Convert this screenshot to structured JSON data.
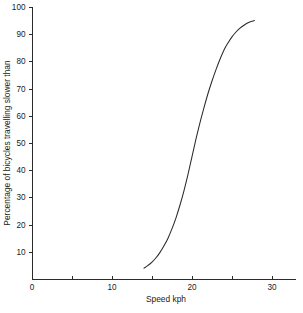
{
  "chart_data": {
    "type": "line",
    "title": "",
    "xlabel": "Speed kph",
    "ylabel": "Percentage of bicycles travelling slower than",
    "xlim": [
      0,
      34
    ],
    "ylim": [
      0,
      100
    ],
    "grid": false,
    "legend": null,
    "x_major_ticks": [
      0,
      10,
      20,
      30
    ],
    "x_minor_ticks": [
      5,
      15,
      25
    ],
    "x_tick_labels": [
      "0",
      "10",
      "20",
      "30"
    ],
    "y_major_ticks": [
      10,
      20,
      30,
      40,
      50,
      60,
      70,
      80,
      90,
      100
    ],
    "y_tick_labels": [
      "10",
      "20",
      "30",
      "40",
      "50",
      "60",
      "70",
      "80",
      "90",
      "100"
    ],
    "series": [
      {
        "name": "Cumulative percentage slower than speed",
        "x": [
          14.0,
          14.5,
          15.0,
          15.5,
          16.0,
          16.5,
          17.0,
          17.5,
          18.0,
          18.5,
          19.0,
          19.5,
          20.0,
          20.5,
          21.0,
          21.5,
          22.0,
          22.5,
          23.0,
          23.5,
          24.0,
          24.5,
          25.0,
          25.5,
          26.0,
          26.5,
          27.0,
          27.5,
          27.8
        ],
        "y": [
          4.0,
          5.0,
          6.2,
          7.8,
          9.8,
          12.2,
          15.0,
          18.5,
          22.5,
          27.2,
          32.5,
          38.5,
          45.0,
          51.5,
          57.5,
          63.0,
          68.2,
          72.8,
          77.0,
          80.8,
          84.2,
          86.8,
          89.0,
          90.8,
          92.2,
          93.3,
          94.2,
          94.8,
          95.0
        ]
      }
    ],
    "annotations": []
  },
  "geometry": {
    "plot_left_px": 32,
    "plot_bottom_px": 279,
    "plot_top_px": 7,
    "plot_right_px": 296,
    "x_axis_end_px": 296,
    "px_per_kph": 8.0,
    "px_per_percent": 2.72,
    "tick_len_px": 4
  }
}
